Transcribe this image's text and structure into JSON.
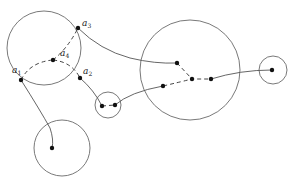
{
  "diagram": {
    "labels": [
      {
        "base": "a",
        "sub": "1"
      },
      {
        "base": "a",
        "sub": "2"
      },
      {
        "base": "a",
        "sub": "3"
      },
      {
        "base": "a",
        "sub": "4"
      }
    ],
    "circles": [
      {
        "name": "large-left",
        "cx": 44,
        "cy": 48,
        "r": 37
      },
      {
        "name": "small-middle",
        "cx": 108,
        "cy": 105,
        "r": 13
      },
      {
        "name": "large-right",
        "cx": 190,
        "cy": 70,
        "r": 50
      },
      {
        "name": "small-far-right",
        "cx": 273,
        "cy": 70,
        "r": 14
      },
      {
        "name": "bottom",
        "cx": 62,
        "cy": 148,
        "r": 28
      }
    ],
    "points": [
      {
        "id": "a1",
        "x": 21,
        "y": 80
      },
      {
        "id": "a2",
        "x": 80,
        "y": 78
      },
      {
        "id": "a3",
        "x": 78,
        "y": 28
      },
      {
        "id": "a4",
        "x": 53,
        "y": 60
      },
      {
        "id": "m1",
        "x": 102,
        "y": 106
      },
      {
        "id": "m2",
        "x": 115,
        "y": 105
      },
      {
        "id": "r1",
        "x": 177,
        "y": 63
      },
      {
        "id": "r2",
        "x": 192,
        "y": 79
      },
      {
        "id": "r3",
        "x": 163,
        "y": 86
      },
      {
        "id": "r4",
        "x": 211,
        "y": 79
      },
      {
        "id": "fr",
        "x": 272,
        "y": 70
      },
      {
        "id": "b1",
        "x": 52,
        "y": 148
      }
    ]
  }
}
